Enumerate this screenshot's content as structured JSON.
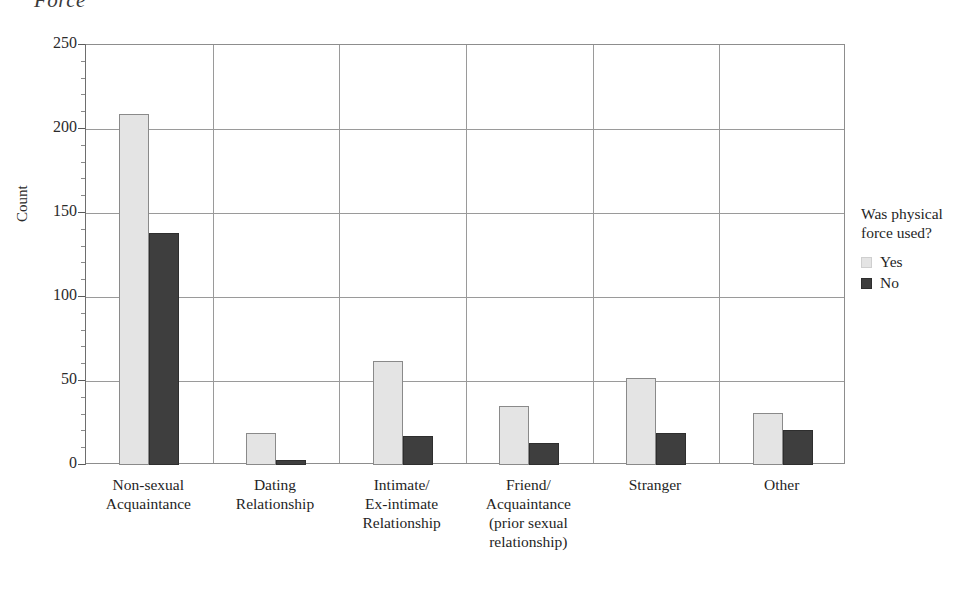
{
  "title_fragment": "Force",
  "chart_data": {
    "type": "bar",
    "title": "Force",
    "xlabel": "",
    "ylabel": "Count",
    "ylim": [
      0,
      250
    ],
    "yticks": [
      0,
      50,
      100,
      150,
      200,
      250
    ],
    "grid": true,
    "legend_position": "right",
    "legend_title": "Was physical force used?",
    "categories": [
      "Non-sexual\nAcquaintance",
      "Dating\nRelationship",
      "Intimate/\nEx-intimate\nRelationship",
      "Friend/\nAcquaintance\n(prior sexual\nrelationship)",
      "Stranger",
      "Other"
    ],
    "series": [
      {
        "name": "Yes",
        "color": "#e4e4e4",
        "values": [
          209,
          19,
          62,
          35,
          52,
          31
        ]
      },
      {
        "name": "No",
        "color": "#3e3e3e",
        "values": [
          138,
          3,
          17,
          13,
          19,
          21
        ]
      }
    ]
  },
  "axis": {
    "y_tick_labels": [
      "250",
      "200",
      "150",
      "100",
      "50",
      "0"
    ],
    "y_title": "Count"
  },
  "legend": {
    "title_line1": "Was physical",
    "title_line2": "force used?",
    "items": [
      {
        "label": "Yes",
        "swatch": "yes"
      },
      {
        "label": "No",
        "swatch": "no"
      }
    ]
  }
}
